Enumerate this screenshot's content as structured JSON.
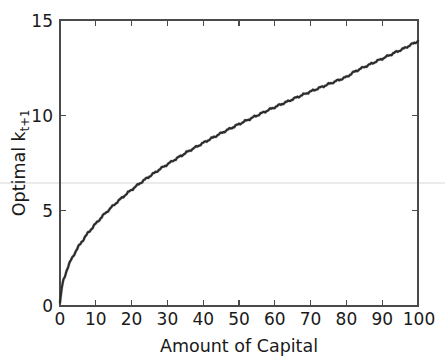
{
  "chart_data": {
    "type": "line",
    "title": "",
    "xlabel": "Amount of Capital",
    "ylabel": "Optimal k",
    "ylabel_subscript": "t+1",
    "xlim": [
      0,
      100
    ],
    "ylim": [
      0,
      15
    ],
    "grid": false,
    "legend": null,
    "xticks": [
      0,
      10,
      20,
      30,
      40,
      50,
      60,
      70,
      80,
      90,
      100
    ],
    "xtick_labels": [
      "0",
      "10",
      "20",
      "30",
      "40",
      "50",
      "60",
      "70",
      "80",
      "90",
      "100"
    ],
    "yticks": [
      0,
      5,
      10,
      15
    ],
    "ytick_labels": [
      "0",
      "5",
      "10",
      "15"
    ],
    "series": [
      {
        "name": "Optimal capital policy",
        "color": "#2b2b2b",
        "x": [
          0,
          0.5,
          1,
          2,
          3,
          4,
          5,
          6,
          7,
          8,
          9,
          10,
          12,
          14,
          16,
          18,
          20,
          22,
          24,
          26,
          28,
          30,
          32,
          34,
          36,
          38,
          40,
          42,
          44,
          46,
          48,
          50,
          52,
          54,
          56,
          58,
          60,
          62,
          64,
          66,
          68,
          70,
          72,
          74,
          76,
          78,
          80,
          82,
          84,
          86,
          88,
          90,
          92,
          94,
          96,
          98,
          100
        ],
        "y": [
          0.15,
          0.95,
          1.38,
          1.94,
          2.38,
          2.74,
          3.06,
          3.35,
          3.62,
          3.87,
          4.1,
          4.32,
          4.74,
          5.11,
          5.46,
          5.79,
          6.1,
          6.39,
          6.67,
          6.93,
          7.19,
          7.43,
          7.67,
          7.9,
          8.13,
          8.34,
          8.55,
          8.76,
          8.96,
          9.16,
          9.35,
          9.54,
          9.72,
          9.9,
          10.08,
          10.26,
          10.43,
          10.6,
          10.76,
          10.93,
          11.09,
          11.25,
          11.4,
          11.56,
          11.71,
          11.86,
          12.01,
          12.26,
          12.45,
          12.62,
          12.8,
          12.97,
          13.15,
          13.33,
          13.5,
          13.7,
          13.9
        ]
      }
    ],
    "annotations": [
      {
        "name": "scan-artifact-line",
        "type": "horizontal-line",
        "y_value": 6.0,
        "color": "#ebebeb"
      }
    ]
  },
  "figure": {
    "background_color": "#ffffff",
    "axis_color": "#4a4a4a",
    "curve_color": "#2b2b2b",
    "text_color": "#1a1a1a"
  }
}
